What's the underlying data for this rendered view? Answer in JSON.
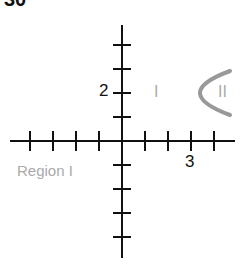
{
  "figure": {
    "number": "30"
  },
  "axes": {
    "x_label_tick": "3",
    "y_label_tick": "2",
    "x_ticks": [
      -4,
      -3,
      -2,
      -1,
      1,
      2,
      3,
      4
    ],
    "y_ticks": [
      4,
      3,
      2,
      1,
      -1,
      -2,
      -3,
      -4
    ]
  },
  "curve": {
    "type": "parabola",
    "vertex": [
      3,
      2
    ],
    "opens": "right",
    "color": "#999999"
  },
  "labels": {
    "region_left": "Region I",
    "region_inside_left": "I",
    "region_inside_right": "II"
  },
  "colors": {
    "axis": "#111111",
    "label_gray": "#aaaaaa"
  }
}
